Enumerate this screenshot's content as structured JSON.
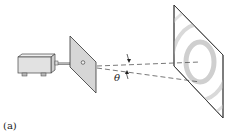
{
  "figure": {
    "caption": "(a)",
    "angle_label": "θ",
    "components": [
      {
        "name": "laser-source",
        "description": "laser box emitting beam"
      },
      {
        "name": "aperture-screen",
        "description": "screen with small pinhole"
      },
      {
        "name": "observation-screen",
        "description": "screen showing concentric diffraction rings"
      }
    ],
    "colors": {
      "line": "#333333",
      "screen_fill": "#d6d6d6",
      "box_fill": "#e2e2e2",
      "ring": "#cfcfcf"
    }
  }
}
